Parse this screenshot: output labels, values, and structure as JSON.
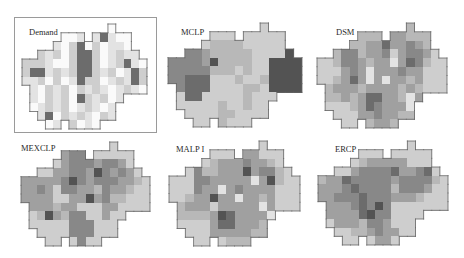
{
  "figure": {
    "grid_legend": {
      ".": "outside region",
      "0": "white / none",
      "1": "very light",
      "2": "light",
      "3": "light-medium",
      "4": "medium",
      "5": "medium-dark",
      "6": "dark",
      "7": "darkest"
    }
  },
  "style": {
    "palette": [
      "#fafafa",
      "#e3e3e3",
      "#cecece",
      "#b8b8b8",
      "#a0a0a0",
      "#888888",
      "#6c6c6c",
      "#535353"
    ],
    "outline_color": "#666666"
  },
  "panels": [
    {
      "label": "Demand",
      "framed": true,
      "grid": [
        "...........0....",
        ".....001.16100..",
        "....1026020110..",
        "..2120266201211.",
        "2221002662012610",
        "2661212662120162",
        "1120201622012162",
        ".102120212101210",
        ".102120621201...",
        ".01212012101....",
        "..1602121021....",
        "...01.2010......"
      ]
    },
    {
      "label": "MCLP",
      "framed": false,
      "grid": [
        "...........2....",
        ".....222.22222..",
        "....2333322222..",
        "..5543333322227.",
        "5555473333227777",
        "5555533323227777",
        "5566622232237777",
        ".566622223327777",
        ".266222223222...",
        ".22222322322....",
        "..2222332222....",
        "...22.3222......"
      ]
    },
    {
      "label": "DSM",
      "framed": false,
      "grid": [
        "...........3....",
        ".....333.44333..",
        "....3344644543..",
        "..3553445245542.",
        "2235543441465322",
        "2224541444544222",
        "2234641414434222",
        ".344434444343222",
        ".334346644314...",
        ".22234654441....",
        "..2224454433....",
        "...22.3443......"
      ]
    },
    {
      "label": "MEXCLP",
      "framed": false,
      "grid": [
        "...........2....",
        ".....455.22222..",
        "....2455545542..",
        "..2244554754542.",
        "4444457545554432",
        "4454255443544322",
        "4444224474533222",
        ".444344222442222",
        ".237435522422...",
        ".22222555222....",
        "..2222555222....",
        "...22.2522......"
      ]
    },
    {
      "label": "MALP I",
      "framed": false,
      "grid": [
        "...........2....",
        ".....222.44222..",
        "....2344454432..",
        "..2533444745532.",
        "2225544444147322",
        "2225441454444222",
        "2234474414434222",
        ".344424444414222",
        ".333347644441...",
        ".22224664443....",
        "..2224444433....",
        "...22.2333......"
      ]
    },
    {
      "label": "ERCP",
      "framed": false,
      "grid": [
        "...........2....",
        ".....222.22222..",
        "....2344444222..",
        "..2245555644562.",
        "3446555554555532",
        "4445655553555422",
        "4455565554443222",
        ".444565752222222",
        ".444467552222...",
        ".24443554222....",
        "..2233454422....",
        "...22.2442......"
      ]
    }
  ]
}
